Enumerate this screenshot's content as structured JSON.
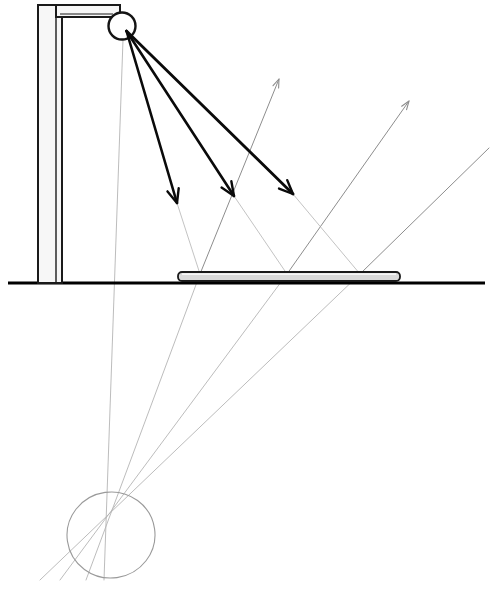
{
  "canvas": {
    "width": 493,
    "height": 589,
    "background": "#ffffff"
  },
  "title": "Specular reflection ray diagram",
  "colors": {
    "incident_ray": "#0a0a0a",
    "reflected_ray": "#8d8d8d",
    "construction_line": "#b4b4b4",
    "ground": "#000000",
    "post_fill": "#f7f7f7",
    "post_stroke": "#1a1a1a",
    "plate_fill": "#d9d9d9",
    "plate_stroke": "#1a1a1a",
    "virtual_ellipse": "#9a9a9a"
  },
  "scene": {
    "ground": {
      "x1": 8,
      "y1": 283,
      "x2": 485,
      "y2": 283,
      "width": 3
    },
    "post": {
      "column": {
        "x": 38,
        "y": 5,
        "width": 24,
        "height": 278,
        "stroke_width": 2
      },
      "inner_line": {
        "x1": 56,
        "y1": 8,
        "x2": 56,
        "y2": 283
      },
      "arm": {
        "x": 56,
        "y": 5,
        "width": 64,
        "height": 12,
        "stroke_width": 2
      },
      "arm_inner": {
        "x1": 60,
        "y1": 14,
        "x2": 113,
        "y2": 14
      }
    },
    "lamp": {
      "label": "light-source",
      "cx": 122,
      "cy": 26,
      "r": 13.5,
      "stroke_width": 2.4,
      "emission_point": {
        "x": 126.5,
        "y": 31
      }
    },
    "plate": {
      "label": "mirror-plate",
      "x": 178,
      "y": 272,
      "width": 222,
      "height": 9,
      "rx": 4,
      "stroke_width": 1.8,
      "top_surface_y": 274
    },
    "virtual_image": {
      "label": "virtual-image-point",
      "cx": 111,
      "cy": 535,
      "rx": 44,
      "ry": 43,
      "rotation": -8,
      "stroke_width": 1.1
    }
  },
  "chart_data": {
    "type": "diagram",
    "title": "Specular reflection ray diagram",
    "incident_rays": [
      {
        "id": 1,
        "from": [
          126.5,
          31
        ],
        "to": [
          177,
          203
        ],
        "arrow": true,
        "width": 2.6
      },
      {
        "id": 2,
        "from": [
          126.5,
          31
        ],
        "to": [
          234,
          196
        ],
        "arrow": true,
        "width": 2.6
      },
      {
        "id": 3,
        "from": [
          126.5,
          31
        ],
        "to": [
          293,
          194
        ],
        "arrow": true,
        "width": 2.8
      }
    ],
    "incident_extensions": [
      {
        "from": [
          177,
          203
        ],
        "to": [
          200,
          274
        ],
        "width": 0.8
      },
      {
        "from": [
          234,
          196
        ],
        "to": [
          287,
          274
        ],
        "width": 0.8
      },
      {
        "from": [
          293,
          194
        ],
        "to": [
          360,
          274
        ],
        "width": 0.8
      }
    ],
    "reflection_points": [
      {
        "id": 1,
        "x": 200,
        "y": 274
      },
      {
        "id": 2,
        "x": 287,
        "y": 274
      },
      {
        "id": 3,
        "x": 360,
        "y": 274
      }
    ],
    "reflected_rays": [
      {
        "id": 1,
        "from": [
          200,
          274
        ],
        "to": [
          279,
          79
        ],
        "arrow": true,
        "width": 1.0
      },
      {
        "id": 2,
        "from": [
          287,
          274
        ],
        "to": [
          409,
          101
        ],
        "arrow": true,
        "width": 1.0
      },
      {
        "id": 3,
        "from": [
          360,
          274
        ],
        "to": [
          489,
          148
        ],
        "arrow": false,
        "width": 1.0
      }
    ],
    "construction_lines": [
      {
        "note": "vertical drop from source through virtual image",
        "from": [
          123,
          40
        ],
        "to": [
          104,
          580
        ],
        "width": 0.9
      },
      {
        "note": "ray 1 extension below plate to virtual point",
        "from": [
          200,
          274
        ],
        "to": [
          86,
          580
        ],
        "width": 0.9
      },
      {
        "note": "ray 2 extension below plate to virtual point",
        "from": [
          287,
          274
        ],
        "to": [
          60,
          580
        ],
        "width": 0.9
      },
      {
        "note": "ray 3 extension below plate to virtual point",
        "from": [
          360,
          274
        ],
        "to": [
          40,
          580
        ],
        "width": 0.9
      }
    ],
    "xlabel": "",
    "ylabel": "",
    "grid": false,
    "legend": false
  }
}
